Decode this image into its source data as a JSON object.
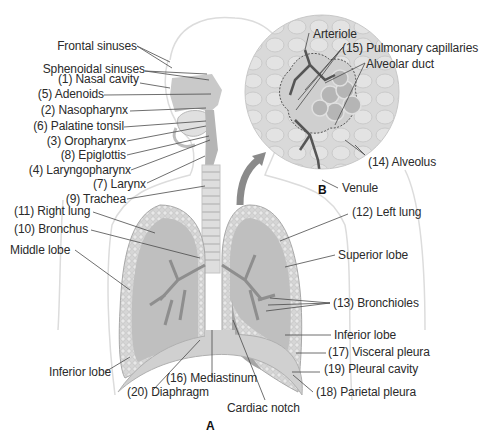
{
  "figure": {
    "panels": [
      {
        "id": "A",
        "label": "A",
        "description": "Upper and lower respiratory tract, frontal section"
      },
      {
        "id": "B",
        "label": "B",
        "description": "Alveolar sac with pulmonary capillaries (magnified)"
      }
    ]
  },
  "labels_left": [
    {
      "text": "Frontal sinuses"
    },
    {
      "text": "Sphenoidal sinuses"
    },
    {
      "text": "(1) Nasal cavity"
    },
    {
      "text": "(5) Adenoids"
    },
    {
      "text": "(2) Nasopharynx"
    },
    {
      "text": "(6) Palatine tonsil"
    },
    {
      "text": "(3) Oropharynx"
    },
    {
      "text": "(8) Epiglottis"
    },
    {
      "text": "(4) Laryngopharynx"
    },
    {
      "text": "(7) Larynx"
    },
    {
      "text": "(9) Trachea"
    },
    {
      "text": "(11) Right lung"
    },
    {
      "text": "(10) Bronchus"
    },
    {
      "text": "Middle lobe"
    },
    {
      "text": "Inferior lobe"
    }
  ],
  "labels_bottom": [
    {
      "text": "(16) Mediastinum"
    },
    {
      "text": "(20) Diaphragm"
    },
    {
      "text": "Cardiac notch"
    }
  ],
  "labels_inset": [
    {
      "text": "Arteriole"
    },
    {
      "text": "(15) Pulmonary capillaries"
    },
    {
      "text": "Alveolar duct"
    },
    {
      "text": "(14) Alveolus"
    },
    {
      "text": "Venule"
    }
  ],
  "labels_right": [
    {
      "text": "(12) Left lung"
    },
    {
      "text": "Superior lobe"
    },
    {
      "text": "(13) Bronchioles"
    },
    {
      "text": "Inferior lobe"
    },
    {
      "text": "(17) Visceral pleura"
    },
    {
      "text": "(19) Pleural cavity"
    },
    {
      "text": "(18) Parietal pleura"
    }
  ],
  "colors": {
    "lung_fill": "#bdbdbd",
    "lung_dark": "#8a8a8a",
    "outline": "#d8d8d8",
    "leader": "#4a4a4a",
    "text": "#2a2a2a"
  }
}
